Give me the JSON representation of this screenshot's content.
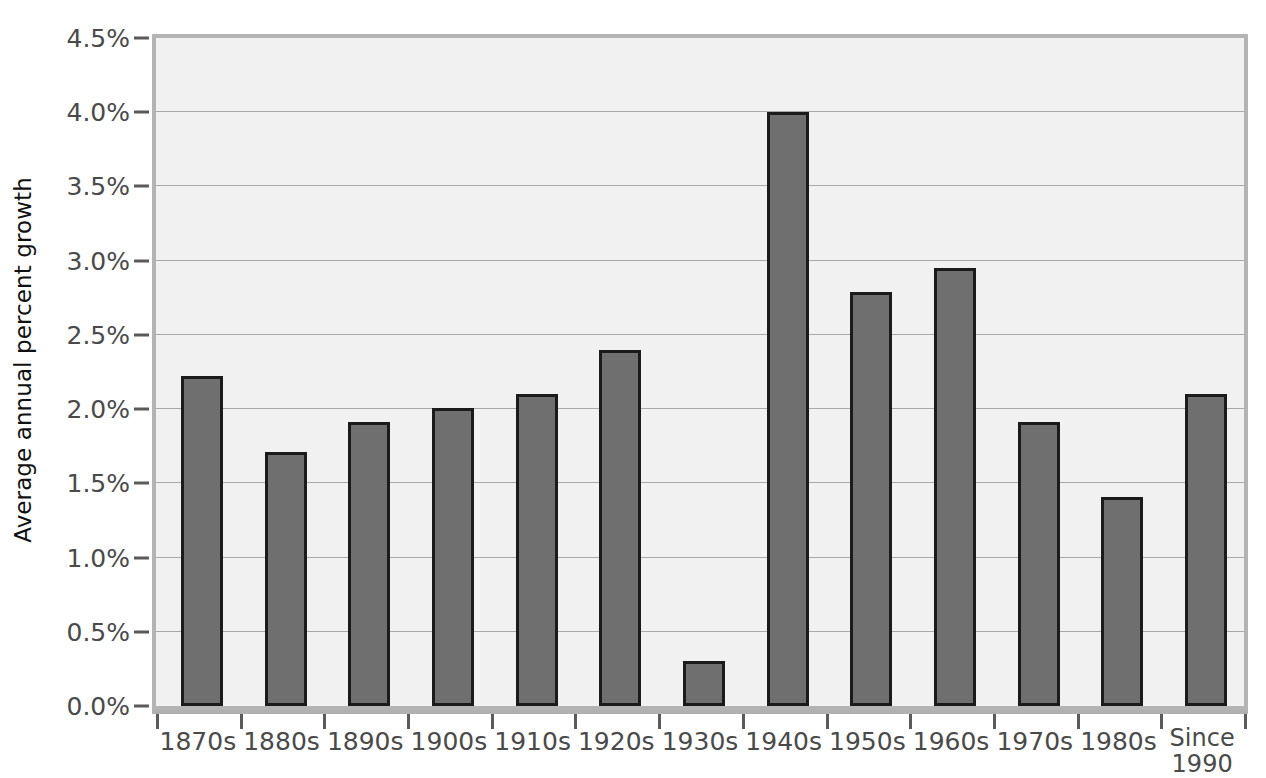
{
  "chart_data": {
    "type": "bar",
    "title": "",
    "xlabel": "",
    "ylabel": "Average annual percent growth",
    "categories": [
      "1870s",
      "1880s",
      "1890s",
      "1900s",
      "1910s",
      "1920s",
      "1930s",
      "1940s",
      "1950s",
      "1960s",
      "1970s",
      "1980s",
      "Since 1990"
    ],
    "values": [
      2.22,
      1.71,
      1.91,
      2.01,
      2.1,
      2.4,
      0.3,
      4.0,
      2.79,
      2.95,
      1.91,
      1.41,
      2.1
    ],
    "ylim": [
      0.0,
      4.5
    ],
    "ytick_values": [
      0.0,
      0.5,
      1.0,
      1.5,
      2.0,
      2.5,
      3.0,
      3.5,
      4.0,
      4.5
    ],
    "ytick_labels": [
      "0.0%",
      "0.5%",
      "1.0%",
      "1.5%",
      "2.0%",
      "2.5%",
      "3.0%",
      "3.5%",
      "4.0%",
      "4.5%"
    ],
    "grid": true,
    "legend": false,
    "bar_color": "#6f6f6f",
    "bar_edge_color": "#1b1b1b",
    "plot_background": "#f1f1f1",
    "gridline_color": "#a9a9a9",
    "axis_frame_color": "#b4b4b4",
    "tick_label_color": "#4a4a4a",
    "axis_title_color": "#111111"
  },
  "xtick_label_lines": [
    [
      "1870s"
    ],
    [
      "1880s"
    ],
    [
      "1890s"
    ],
    [
      "1900s"
    ],
    [
      "1910s"
    ],
    [
      "1920s"
    ],
    [
      "1930s"
    ],
    [
      "1940s"
    ],
    [
      "1950s"
    ],
    [
      "1960s"
    ],
    [
      "1970s"
    ],
    [
      "1980s"
    ],
    [
      "Since",
      "1990"
    ]
  ]
}
